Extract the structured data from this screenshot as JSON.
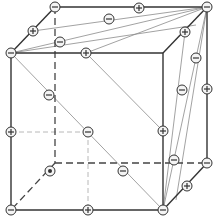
{
  "diagram": {
    "colors": {
      "edge": "#333333",
      "hidden_edge": "#444444",
      "inner_line": "#8a8a8a",
      "inner_dashed": "#b0b0b0",
      "node_stroke": "#333333",
      "node_fill": "#f4f4f4"
    },
    "vertices": {
      "front_tl": [
        11,
        53
      ],
      "front_tr": [
        163,
        53
      ],
      "front_br": [
        163,
        210
      ],
      "front_bl": [
        11,
        210
      ],
      "back_tl": [
        55,
        7
      ],
      "back_tr": [
        207,
        7
      ],
      "back_br": [
        207,
        163
      ],
      "back_bl": [
        55,
        163
      ]
    },
    "solid_edges": [
      [
        [
          11,
          53
        ],
        [
          163,
          53
        ]
      ],
      [
        [
          163,
          53
        ],
        [
          163,
          210
        ]
      ],
      [
        [
          163,
          210
        ],
        [
          11,
          210
        ]
      ],
      [
        [
          11,
          210
        ],
        [
          11,
          53
        ]
      ],
      [
        [
          11,
          53
        ],
        [
          55,
          7
        ]
      ],
      [
        [
          55,
          7
        ],
        [
          207,
          7
        ]
      ],
      [
        [
          207,
          7
        ],
        [
          207,
          163
        ]
      ],
      [
        [
          163,
          53
        ],
        [
          207,
          7
        ]
      ],
      [
        [
          163,
          210
        ],
        [
          207,
          163
        ]
      ]
    ],
    "hidden_edges": [
      [
        [
          55,
          7
        ],
        [
          55,
          163
        ]
      ],
      [
        [
          55,
          163
        ],
        [
          207,
          163
        ]
      ],
      [
        [
          55,
          163
        ],
        [
          11,
          210
        ]
      ]
    ],
    "inner_lines": [
      [
        [
          11,
          53
        ],
        [
          207,
          7
        ]
      ],
      [
        [
          33,
          31
        ],
        [
          207,
          7
        ]
      ],
      [
        [
          11,
          53
        ],
        [
          196,
          25
        ]
      ],
      [
        [
          86,
          53
        ],
        [
          207,
          7
        ]
      ],
      [
        [
          11,
          53
        ],
        [
          163,
          210
        ]
      ],
      [
        [
          86,
          53
        ],
        [
          163,
          131
        ]
      ],
      [
        [
          207,
          7
        ],
        [
          163,
          210
        ]
      ],
      [
        [
          207,
          7
        ],
        [
          176,
          200
        ]
      ],
      [
        [
          185,
          32
        ],
        [
          163,
          210
        ]
      ]
    ],
    "inner_dashed": [
      [
        [
          11,
          132
        ],
        [
          88,
          132
        ]
      ],
      [
        [
          88,
          132
        ],
        [
          88,
          210
        ]
      ]
    ],
    "nodes": [
      {
        "x": 55,
        "y": 7,
        "sign": "−"
      },
      {
        "x": 139,
        "y": 8,
        "sign": "+"
      },
      {
        "x": 207,
        "y": 7,
        "sign": "−"
      },
      {
        "x": 33,
        "y": 31,
        "sign": "+"
      },
      {
        "x": 109,
        "y": 19,
        "sign": "−"
      },
      {
        "x": 185,
        "y": 32,
        "sign": "+"
      },
      {
        "x": 60,
        "y": 42,
        "sign": "−"
      },
      {
        "x": 11,
        "y": 53,
        "sign": "−"
      },
      {
        "x": 86,
        "y": 53,
        "sign": "+"
      },
      {
        "x": 196,
        "y": 58,
        "sign": "−"
      },
      {
        "x": 49,
        "y": 95,
        "sign": "−"
      },
      {
        "x": 182,
        "y": 90,
        "sign": "−"
      },
      {
        "x": 207,
        "y": 89,
        "sign": "+"
      },
      {
        "x": 163,
        "y": 131,
        "sign": "+"
      },
      {
        "x": 174,
        "y": 160,
        "sign": "−"
      },
      {
        "x": 11,
        "y": 132,
        "sign": "+"
      },
      {
        "x": 88,
        "y": 132,
        "sign": "−"
      },
      {
        "x": 207,
        "y": 163,
        "sign": "−"
      },
      {
        "x": 123,
        "y": 171,
        "sign": "−"
      },
      {
        "x": 50,
        "y": 171,
        "sign": "•"
      },
      {
        "x": 187,
        "y": 186,
        "sign": "+"
      },
      {
        "x": 11,
        "y": 210,
        "sign": "−"
      },
      {
        "x": 88,
        "y": 210,
        "sign": "+"
      },
      {
        "x": 163,
        "y": 210,
        "sign": "−"
      }
    ]
  }
}
